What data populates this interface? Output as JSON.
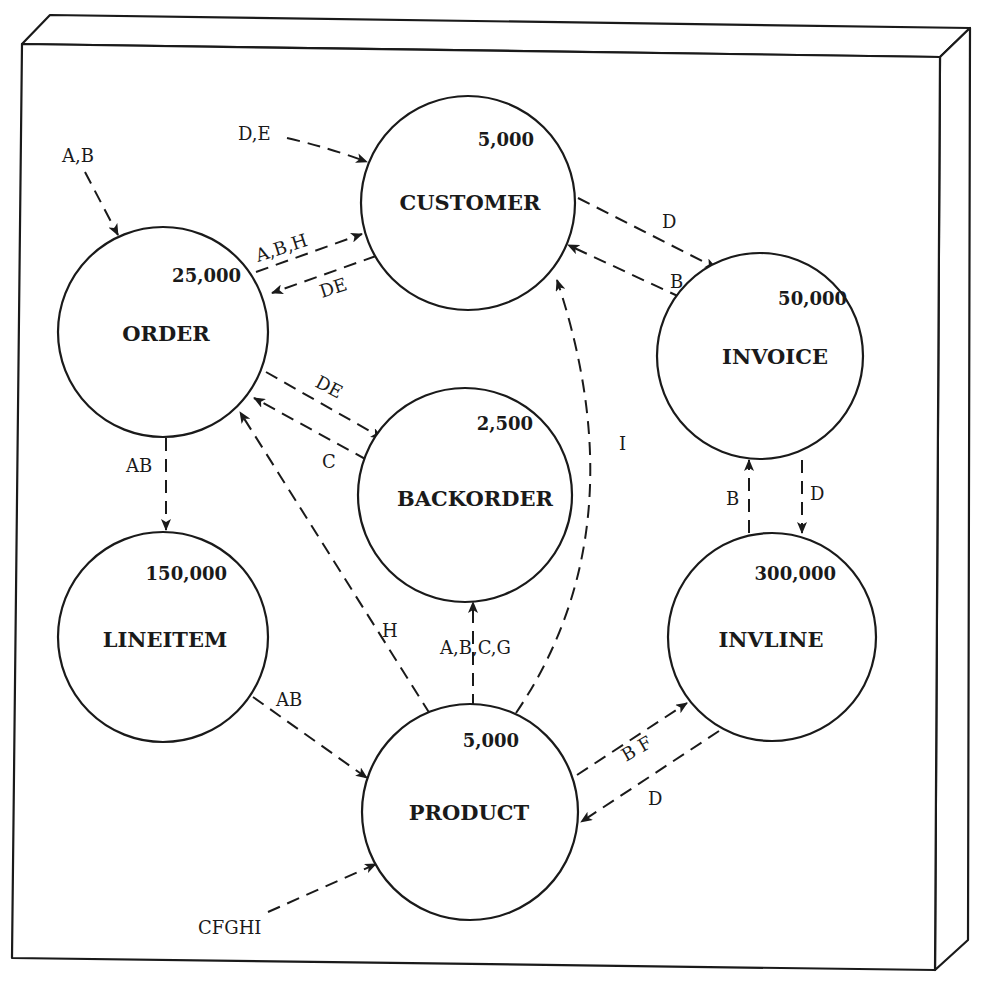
{
  "diagram": {
    "nodes": [
      {
        "id": "customer",
        "name": "CUSTOMER",
        "count": "5,000"
      },
      {
        "id": "order",
        "name": "ORDER",
        "count": "25,000"
      },
      {
        "id": "invoice",
        "name": "INVOICE",
        "count": "50,000"
      },
      {
        "id": "backorder",
        "name": "BACKORDER",
        "count": "2,500"
      },
      {
        "id": "lineitem",
        "name": "LINEITEM",
        "count": "150,000"
      },
      {
        "id": "invline",
        "name": "INVLINE",
        "count": "300,000"
      },
      {
        "id": "product",
        "name": "PRODUCT",
        "count": "5,000"
      }
    ],
    "edges": [
      {
        "id": "ext-to-order",
        "from": "external",
        "to": "order",
        "label": "A,B"
      },
      {
        "id": "ext-to-customer",
        "from": "external",
        "to": "customer",
        "label": "D,E"
      },
      {
        "id": "order-to-customer",
        "from": "order",
        "to": "customer",
        "label": "A,B,H"
      },
      {
        "id": "customer-to-order",
        "from": "customer",
        "to": "order",
        "label": "DE"
      },
      {
        "id": "customer-to-invoice",
        "from": "customer",
        "to": "invoice",
        "label": "D"
      },
      {
        "id": "invoice-to-customer",
        "from": "invoice",
        "to": "customer",
        "label": "B"
      },
      {
        "id": "order-to-backorder",
        "from": "order",
        "to": "backorder",
        "label": "DE"
      },
      {
        "id": "backorder-to-order",
        "from": "backorder",
        "to": "order",
        "label": "C"
      },
      {
        "id": "product-to-customer",
        "from": "product",
        "to": "customer",
        "label": "I"
      },
      {
        "id": "order-to-lineitem",
        "from": "order",
        "to": "lineitem",
        "label": "AB"
      },
      {
        "id": "product-to-order",
        "from": "product",
        "to": "order",
        "label": "H"
      },
      {
        "id": "product-to-backorder",
        "from": "product",
        "to": "backorder",
        "label": "A,B,C,G"
      },
      {
        "id": "invline-to-invoice",
        "from": "invline",
        "to": "invoice",
        "label": "B"
      },
      {
        "id": "invoice-to-invline",
        "from": "invoice",
        "to": "invline",
        "label": "D"
      },
      {
        "id": "lineitem-to-product",
        "from": "lineitem",
        "to": "product",
        "label": "AB"
      },
      {
        "id": "product-to-invline",
        "from": "product",
        "to": "invline",
        "label": "B  F"
      },
      {
        "id": "invline-to-product",
        "from": "invline",
        "to": "product",
        "label": "D"
      },
      {
        "id": "ext-to-product",
        "from": "external",
        "to": "product",
        "label": "CFGHI"
      }
    ]
  },
  "colors": {
    "line": "#1a1a1a",
    "background": "#ffffff"
  }
}
